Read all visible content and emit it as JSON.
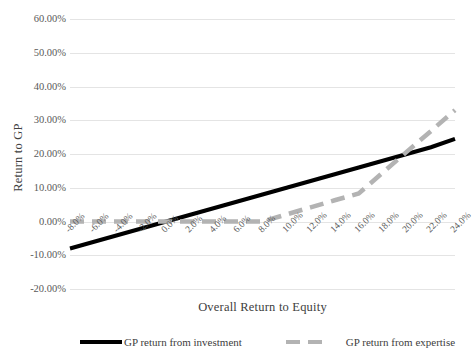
{
  "chart_data": {
    "type": "line",
    "title": "",
    "xlabel": "Overall Return to Equity",
    "ylabel": "Return to GP",
    "xlim": [
      -8,
      24
    ],
    "ylim": [
      -20,
      60
    ],
    "grid": true,
    "legend_position": "bottom",
    "x": [
      -8,
      -6,
      -4,
      -2,
      0,
      2,
      4,
      6,
      8,
      10,
      12,
      14,
      16,
      18,
      20,
      22,
      24
    ],
    "xtick_labels": [
      "-8.0%",
      "-6.0%",
      "-4.0%",
      "-2.0%",
      "0.0%",
      "2.0%",
      "4.0%",
      "6.0%",
      "8.0%",
      "10.0%",
      "12.0%",
      "14.0%",
      "16.0%",
      "18.0%",
      "20.0%",
      "22.0%",
      "24.0%"
    ],
    "ytick_labels": [
      "60.00%",
      "50.00%",
      "40.00%",
      "30.00%",
      "20.00%",
      "10.00%",
      "0.00%",
      "-10.00%",
      "-20.00%"
    ],
    "ytick_values": [
      60,
      50,
      40,
      30,
      20,
      10,
      0,
      -10,
      -20
    ],
    "series": [
      {
        "name": "GP return from investment",
        "color": "#000000",
        "style": "solid",
        "width": 4,
        "values": [
          -8,
          -6,
          -4,
          -2,
          0,
          2,
          4,
          6,
          8,
          10,
          12,
          14,
          16,
          18,
          20,
          22,
          24.5
        ]
      },
      {
        "name": "GP return from expertise",
        "color": "#b3b3b3",
        "style": "dashed",
        "width": 4.5,
        "values": [
          0,
          0,
          0,
          0,
          0,
          0,
          0,
          0,
          0,
          2.1,
          4.2,
          6.3,
          8.3,
          14.5,
          20.7,
          26.8,
          33.0
        ]
      }
    ],
    "legend": [
      {
        "label": "GP return from investment",
        "color": "#000000",
        "style": "solid"
      },
      {
        "label": "GP return from expertise",
        "color": "#b3b3b3",
        "style": "dashed"
      }
    ]
  }
}
